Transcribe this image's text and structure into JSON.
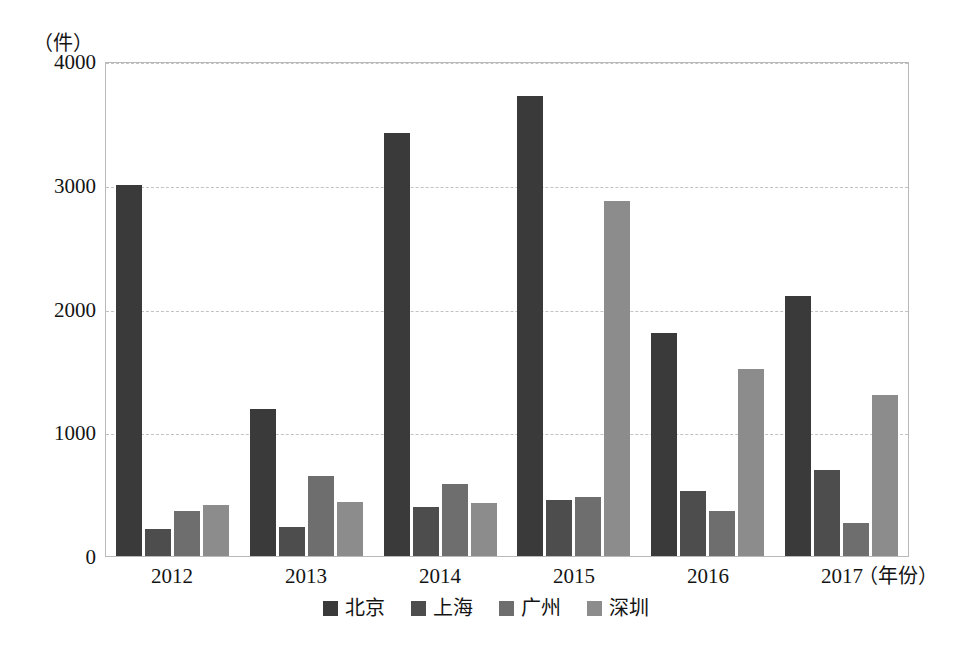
{
  "chart_data": {
    "type": "bar",
    "title": "",
    "subtitle": "",
    "xlabel": "（年份）",
    "ylabel": "（件）",
    "categories": [
      "2012",
      "2013",
      "2014",
      "2015",
      "2016",
      "2017"
    ],
    "series": [
      {
        "name": "北京",
        "color": "#3a3a3a",
        "values": [
          3000,
          1190,
          3420,
          3715,
          1800,
          2100
        ]
      },
      {
        "name": "上海",
        "color": "#4d4d4d",
        "values": [
          215,
          235,
          400,
          455,
          525,
          695
        ]
      },
      {
        "name": "广州",
        "color": "#6e6e6e",
        "values": [
          360,
          650,
          585,
          480,
          365,
          270
        ]
      },
      {
        "name": "深圳",
        "color": "#8c8c8c",
        "values": [
          410,
          435,
          425,
          2870,
          1510,
          1300
        ]
      }
    ],
    "ylim": [
      0,
      4000
    ],
    "yticks": [
      0,
      1000,
      2000,
      3000,
      4000
    ],
    "ytick_labels": [
      "0",
      "1000",
      "2000",
      "3000",
      "4000"
    ],
    "grid": true,
    "grid_axis": "y",
    "legend_position": "bottom",
    "bar_edge": "none"
  }
}
